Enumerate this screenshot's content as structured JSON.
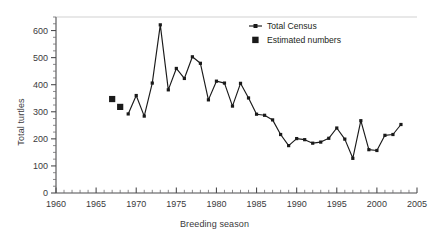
{
  "chart_data": {
    "type": "line",
    "title": "",
    "xlabel": "Breeding season",
    "ylabel": "Total turtles",
    "xlim": [
      1960,
      2005
    ],
    "ylim": [
      0,
      650
    ],
    "xticks": [
      1960,
      1965,
      1970,
      1975,
      1980,
      1985,
      1990,
      1995,
      2000,
      2005
    ],
    "yticks": [
      0,
      100,
      200,
      300,
      400,
      500,
      600
    ],
    "xtick_labels": [
      "1960",
      "1965",
      "1970",
      "1975",
      "1980",
      "1985",
      "1990",
      "1995",
      "2000",
      "2005"
    ],
    "ytick_labels": [
      "0",
      "100",
      "200",
      "300",
      "400",
      "500",
      "600"
    ],
    "minor_x_interval": 1,
    "minor_y_interval": 25,
    "grid": false,
    "legend_position": "top-right",
    "series": [
      {
        "name": "Total Census",
        "marker": "square-small",
        "line": true,
        "color": "#1a1a1a",
        "x": [
          1969,
          1970,
          1971,
          1972,
          1973,
          1974,
          1975,
          1976,
          1977,
          1978,
          1979,
          1980,
          1981,
          1982,
          1983,
          1984,
          1985,
          1986,
          1987,
          1988,
          1989,
          1990,
          1991,
          1992,
          1993,
          1994,
          1995,
          1996,
          1997,
          1998,
          1999,
          2000,
          2001,
          2002,
          2003
        ],
        "values": [
          292,
          360,
          284,
          406,
          621,
          381,
          460,
          423,
          503,
          479,
          344,
          413,
          406,
          321,
          405,
          351,
          291,
          287,
          270,
          216,
          175,
          201,
          197,
          184,
          188,
          202,
          240,
          199,
          128,
          267,
          160,
          157,
          213,
          216,
          253
        ]
      },
      {
        "name": "Estimated numbers",
        "marker": "square-large",
        "line": false,
        "color": "#1a1a1a",
        "x": [
          1967,
          1968
        ],
        "values": [
          347,
          318
        ]
      }
    ],
    "legend": [
      {
        "label": "Total Census",
        "marker": "line-with-square"
      },
      {
        "label": "Estimated numbers",
        "marker": "square-large"
      }
    ]
  },
  "axis": {
    "x_title": "Breeding season",
    "y_title": "Total turtles"
  }
}
